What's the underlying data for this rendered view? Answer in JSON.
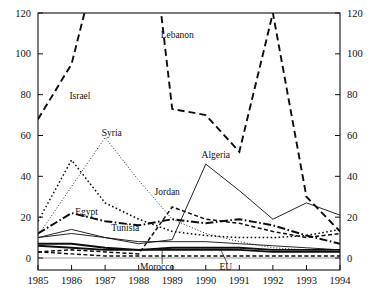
{
  "chart_data": {
    "type": "line",
    "title": "",
    "subtitle": "",
    "xlabel": "",
    "ylabel": "",
    "x": [
      1985,
      1986,
      1987,
      1988,
      1989,
      1990,
      1991,
      1992,
      1993,
      1994
    ],
    "xtick_labels": [
      "1985",
      "1986",
      "1987",
      "1988",
      "1989",
      "1990",
      "1991",
      "1992",
      "1993",
      "1994"
    ],
    "ytick_labels": [
      "0",
      "20",
      "40",
      "60",
      "80",
      "100",
      "120"
    ],
    "ytick_values": [
      0,
      20,
      40,
      60,
      80,
      100,
      120
    ],
    "ylim": [
      0,
      120
    ],
    "xlim": [
      1985,
      1994
    ],
    "dual_y_axis": true,
    "right_ytick_labels": [
      "0",
      "20",
      "40",
      "60",
      "80",
      "100",
      "120"
    ],
    "grid": false,
    "legend_position": "inline-annotations",
    "clipped_above_axis_max": true,
    "series": [
      {
        "name": "Lebanon",
        "style": "long-dash",
        "width": 1.9,
        "label_x": 1989.15,
        "label_y": 108,
        "values": [
          68,
          95,
          160,
          215,
          73,
          70,
          52,
          120,
          30,
          13
        ]
      },
      {
        "name": "Israel",
        "style": "dotted",
        "width": 1.5,
        "label_x": 1986.25,
        "label_y": 78,
        "values": [
          18,
          48,
          27,
          19,
          13,
          11,
          10,
          10,
          11,
          14
        ]
      },
      {
        "name": "Syria",
        "style": "fine-dotted",
        "width": 0.9,
        "label_x": 1987.2,
        "label_y": 60,
        "values": [
          11,
          35,
          59,
          38,
          19,
          12,
          8,
          5,
          4,
          3
        ]
      },
      {
        "name": "Algeria",
        "style": "solid-thin",
        "width": 0.9,
        "label_x": 1990.3,
        "label_y": 49,
        "values": [
          10,
          12,
          10,
          7,
          9,
          46,
          33,
          19,
          27,
          21
        ]
      },
      {
        "name": "Jordan",
        "style": "short-dash",
        "width": 1.5,
        "label_x": 1988.85,
        "label_y": 31,
        "values": [
          3,
          4,
          3,
          2,
          25,
          19,
          17,
          13,
          10,
          12
        ]
      },
      {
        "name": "Egypt",
        "style": "dash-dot",
        "width": 2.0,
        "label_x": 1986.45,
        "label_y": 21,
        "values": [
          12,
          22,
          18,
          16,
          19,
          17,
          19,
          16,
          11,
          7
        ]
      },
      {
        "name": "Tunisia",
        "style": "solid-thin",
        "width": 0.9,
        "label_x": 1987.6,
        "label_y": 13,
        "values": [
          10,
          14,
          10,
          8,
          8,
          8,
          7,
          6,
          5,
          4
        ]
      },
      {
        "name": "Morocco",
        "style": "solid-thick",
        "width": 1.9,
        "label_x": 1988.55,
        "label_y": -6,
        "leader_from_x": 1988.7,
        "leader_from_y": -3,
        "leader_to_x": 1988.7,
        "leader_to_y": 5,
        "values": [
          7,
          7,
          5,
          4,
          5,
          5,
          5,
          4,
          4,
          4
        ]
      },
      {
        "name": "EU",
        "style": "solid-thick",
        "width": 1.9,
        "label_x": 1990.6,
        "label_y": -6,
        "leader_from_x": 1990.65,
        "leader_from_y": -3,
        "leader_to_x": 1990.45,
        "leader_to_y": 4,
        "values": [
          6,
          5,
          4,
          4,
          4,
          4,
          4,
          3,
          3,
          3
        ]
      },
      {
        "name": "unlabeled-dashed-low",
        "style": "short-dash",
        "width": 1.4,
        "label_x": null,
        "label_y": null,
        "values": [
          3,
          2,
          1,
          1,
          1,
          1,
          1,
          1,
          1,
          1
        ]
      }
    ]
  },
  "axes": {
    "left_axis_name": "left-value-axis",
    "right_axis_name": "right-value-axis",
    "bottom_axis_name": "year-axis"
  }
}
